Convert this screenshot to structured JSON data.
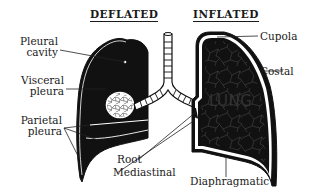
{
  "diagram": {
    "titles": {
      "left": "DEFLATED",
      "right": "INFLATED"
    },
    "center_label": "LUNG",
    "labels": {
      "pleural_cavity": [
        "Pleural",
        "cavity"
      ],
      "visceral_pleura": [
        "Visceral",
        "pleura"
      ],
      "parietal_pleura": [
        "Parietal",
        "pleura"
      ],
      "root": "Root",
      "mediastinal": "Mediastinal",
      "cupola": "Cupola",
      "costal": "Costal",
      "diaphragmatic": "Diaphragmatic"
    },
    "colors": {
      "ink": "#1a1a1a",
      "fill_dark": "#111111",
      "paper": "#ffffff"
    }
  }
}
